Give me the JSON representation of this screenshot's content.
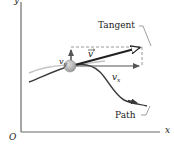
{
  "diagram": {
    "axes": {
      "y_label": "y",
      "x_label": "x",
      "origin_label": "O"
    },
    "labels": {
      "tangent": "Tangent",
      "path": "Path",
      "v": "v",
      "vx_base": "v",
      "vx_sub": "x",
      "vy_base": "v",
      "vy_sub": "y"
    },
    "colors": {
      "axis": "#6b6b6b",
      "path": "#3a3a3a",
      "trajectory_light": "#bdbdbd",
      "velocity_vector": "#222222",
      "components": "#555555",
      "dashed": "#9a9a9a",
      "particle": "#a9a9a9"
    }
  }
}
